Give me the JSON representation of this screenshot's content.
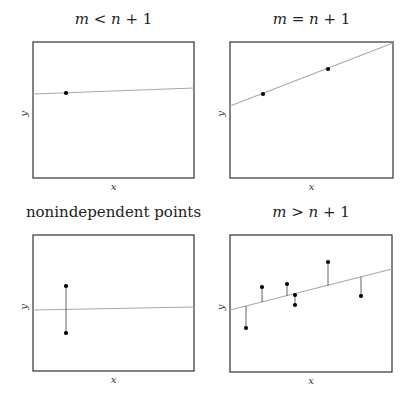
{
  "colors": {
    "frame": "#333333",
    "fit_line": "#a8a8a8",
    "point": "#000000",
    "residual": "#555555"
  },
  "chart_data": [
    {
      "type": "scatter",
      "title": "m < n + 1",
      "title_parts": [
        "m",
        " < ",
        "n",
        " + 1"
      ],
      "xlabel": "x",
      "ylabel": "y",
      "frame": [
        33,
        42,
        194,
        178
      ],
      "line": [
        33,
        94,
        194,
        88
      ],
      "points": [
        [
          66,
          93
        ]
      ],
      "residuals": []
    },
    {
      "type": "scatter",
      "title": "m = n + 1",
      "title_parts": [
        "m",
        " = ",
        "n",
        " + 1"
      ],
      "xlabel": "x",
      "ylabel": "y",
      "frame": [
        230,
        42,
        393,
        178
      ],
      "line": [
        230,
        106,
        393,
        43
      ],
      "points": [
        [
          263,
          94
        ],
        [
          328,
          69
        ]
      ],
      "residuals": []
    },
    {
      "type": "scatter",
      "title": "nonindependent points",
      "title_parts": [
        "",
        "nonindependent points",
        "",
        ""
      ],
      "xlabel": "x",
      "ylabel": "y",
      "frame": [
        33,
        235,
        194,
        371
      ],
      "line": [
        33,
        310,
        194,
        307
      ],
      "points": [
        [
          66,
          286
        ],
        [
          66,
          333
        ]
      ],
      "residuals": [
        [
          66,
          286,
          66,
          333
        ]
      ]
    },
    {
      "type": "scatter",
      "title": "m > n + 1",
      "title_parts": [
        "m",
        " > ",
        "n",
        " + 1"
      ],
      "xlabel": "x",
      "ylabel": "y",
      "frame": [
        230,
        235,
        392,
        372
      ],
      "line": [
        230,
        310,
        392,
        269
      ],
      "points": [
        [
          246,
          328
        ],
        [
          262,
          287
        ],
        [
          287,
          284
        ],
        [
          295,
          295
        ],
        [
          295,
          305
        ],
        [
          328,
          262
        ],
        [
          361,
          296
        ]
      ],
      "residuals": [
        [
          246,
          306,
          246,
          328
        ],
        [
          262,
          302,
          262,
          287
        ],
        [
          287,
          296,
          287,
          284
        ],
        [
          295,
          294,
          295,
          305
        ],
        [
          328,
          286,
          328,
          262
        ],
        [
          361,
          277,
          361,
          296
        ]
      ]
    }
  ]
}
